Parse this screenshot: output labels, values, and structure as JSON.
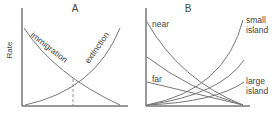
{
  "panel_a": {
    "title": "A",
    "ylabel": "Rate",
    "curves": {
      "immigration": "immigration",
      "extinction": "extinction"
    }
  },
  "panel_b": {
    "title": "B",
    "labels": {
      "near": "near",
      "far": "far",
      "small_line1": "small",
      "small_line2": "island",
      "large_line1": "large",
      "large_line2": "island"
    }
  },
  "colors": {
    "axis": "#333333",
    "curve": "#777777",
    "text": "#444444"
  }
}
